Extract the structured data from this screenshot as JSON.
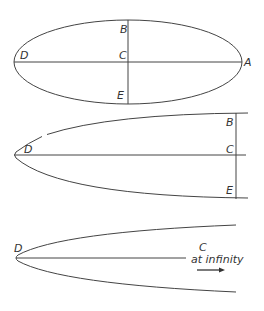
{
  "figures": [
    {
      "id": "ellipse",
      "labels": {
        "B": "B",
        "C": "C",
        "D": "D",
        "E": "E",
        "A": "A"
      }
    },
    {
      "id": "elongated-ellipse",
      "labels": {
        "B": "B",
        "C": "C",
        "D": "D",
        "E": "E"
      }
    },
    {
      "id": "parabola",
      "labels": {
        "D": "D",
        "C": "C",
        "note": "at infinity"
      }
    }
  ],
  "colors": {
    "line": "#444444",
    "text": "#333333",
    "background": "#ffffff"
  }
}
